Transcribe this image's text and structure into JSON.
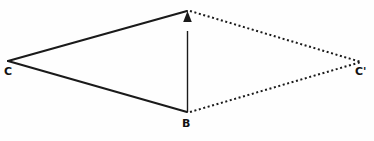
{
  "figure": {
    "type": "geometry-diagram",
    "background_color": "#fefefe",
    "stroke_color": "#1a1a1a",
    "label_color": "#111111",
    "points": {
      "C": {
        "label": "C",
        "x": 8,
        "y": 61
      },
      "apex": {
        "label": "",
        "x": 187,
        "y": 11
      },
      "B": {
        "label": "B",
        "x": 187,
        "y": 112
      },
      "Cprime": {
        "label": "C'",
        "x": 361,
        "y": 62
      }
    },
    "edges": [
      {
        "name": "C-to-apex",
        "style": "solid",
        "from": "C",
        "to": "apex",
        "width": 2.2
      },
      {
        "name": "C-to-B",
        "style": "solid",
        "from": "C",
        "to": "B",
        "width": 2.2
      },
      {
        "name": "apex-to-Cprime",
        "style": "dotted",
        "from": "apex",
        "to": "Cprime",
        "width": 2.0
      },
      {
        "name": "B-to-Cprime",
        "style": "dotted",
        "from": "B",
        "to": "Cprime",
        "width": 2.0
      }
    ],
    "arrow": {
      "name": "B-to-apex-arrow",
      "style": "solid",
      "from": "B",
      "to": "apex",
      "head": "triangle-up",
      "width": 1.3
    },
    "labels": {
      "C": "C",
      "B": "B",
      "Cprime": "C'"
    }
  }
}
